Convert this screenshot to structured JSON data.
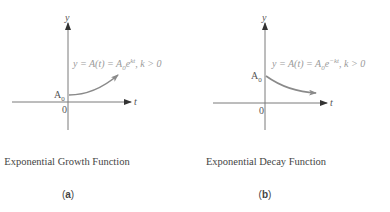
{
  "panels": [
    {
      "id": "a",
      "y_axis_label": "y",
      "x_axis_label": "t",
      "origin_label": "0",
      "intercept_label": "A",
      "intercept_sub": "0",
      "equation": {
        "lhs": "y = A(t) = A",
        "sub": "0",
        "base": "e",
        "exponent": "kt",
        "condition": ",  k > 0"
      },
      "caption": "Exponential Growth Function",
      "sublabel_open": "(",
      "sublabel": "a",
      "sublabel_close": ")"
    },
    {
      "id": "b",
      "y_axis_label": "y",
      "x_axis_label": "t",
      "origin_label": "0",
      "intercept_label": "A",
      "intercept_sub": "0",
      "equation": {
        "lhs": "y = A(t) = A",
        "sub": "0",
        "base": "e",
        "exponent": "−kt",
        "condition": ",  k > 0"
      },
      "caption": "Exponential Decay Function",
      "sublabel_open": "(",
      "sublabel": "b",
      "sublabel_close": ")"
    }
  ],
  "colors": {
    "axis": "#7a7a7a",
    "curve": "#8a8a8a",
    "equation_text": "#9a9a9a"
  }
}
